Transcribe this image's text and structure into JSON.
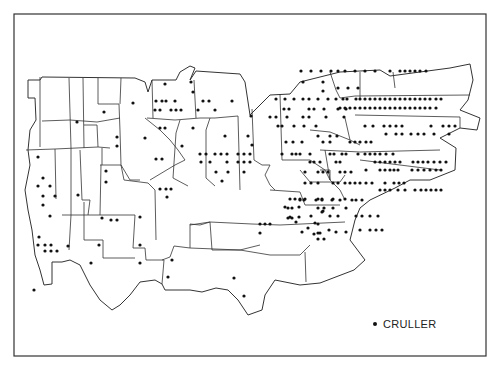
{
  "figure": {
    "type": "dot-distribution-map",
    "legend": {
      "symbol": "dot",
      "label": "CRULLER"
    },
    "colors": {
      "background": "#ffffff",
      "boundary": "#333333",
      "dot": "#111111"
    }
  },
  "map": {
    "frame": {
      "x": 14,
      "y": 14,
      "w": 472,
      "h": 342
    },
    "outline": "M28,80 L40,80 L42,77 L135,78 L145,82 L148,92 L152,80 L176,80 L180,72 L190,66 L195,68 L190,80 L196,71 L240,74 L245,82 L250,115 L270,95 L290,94 L300,82 L340,72 L380,70 L390,76 L420,72 L450,68 L470,64 L473,80 L468,100 L460,110 L480,118 L477,130 L460,128 L440,138 L456,148 L455,170 L430,180 L410,180 L395,188 L370,200 L360,208 L355,220 L350,240 L365,260 L354,270 L320,283 L300,285 L275,280 L265,295 L262,310 L248,315 L238,300 L228,290 L216,288 L202,292 L190,290 L180,290 L165,290 L162,284 L155,280 L140,282 L130,295 L120,305 L112,310 L100,300 L90,285 L80,265 L70,260 L62,262 L52,262 L52,284 L44,285 L40,270 L35,255 L32,230 L28,210 L25,190 L30,165 L28,150 L30,130 L36,120 L35,98 L28,98 Z",
    "boundaries": [
      "M42,121 L70,120 L97,122 L120,118",
      "M40,77 L40,147",
      "M69,78 L71,148",
      "M83,78 L84,148",
      "M98,78 L98,104 L119,104 L120,131 L121,165",
      "M121,78 L120,104",
      "M84,125 L97,125 L98,147",
      "M26,150 L55,149 L56,199",
      "M55,149 L98,147 L110,148",
      "M71,148 L71,215 L69,250",
      "M80,150 L82,200 L90,200 L88,215",
      "M102,148 L102,165",
      "M100,165 L121,165 L130,180 L140,180",
      "M121,165 L124,180 L148,183 L155,190 L156,240",
      "M101,165 L100,215",
      "M62,215 L135,215",
      "M135,215 L133,248 L145,248 L146,260 L164,260 L162,284",
      "M162,260 L170,257 L174,246 L190,248 L190,224 L200,225 L210,222",
      "M190,225 L210,222 L252,224",
      "M84,202 L84,240 L103,240 L103,258 L135,258",
      "M150,180 L175,165 L185,160 L178,150 L170,140 L160,130 L145,118",
      "M147,118 L175,120 L200,118 L215,118 L238,116",
      "M153,118 L152,80",
      "M196,118 L194,80",
      "M180,120 L176,133 L173,178 L188,186",
      "M210,118 L206,130 L206,178 L215,186",
      "M238,116 L240,190",
      "M252,109 L254,160 L262,165 L270,165",
      "M280,94 L282,160 L310,160",
      "M310,160 L325,170 L330,180",
      "M270,165 L265,175 L270,185 L275,190",
      "M330,72 L336,90 L340,98 L355,96",
      "M360,72 L360,98",
      "M393,72 L395,88",
      "M355,96 L470,95",
      "M355,115 L460,117 L460,128",
      "M345,118 L350,140 L360,145",
      "M310,130 L330,132 L350,140",
      "M320,150 L360,152 L440,150",
      "M325,150 L330,180 L340,190 L345,200",
      "M360,160 L440,170",
      "M300,170 L310,182 L340,182 L345,175",
      "M320,170 L330,170 L330,180",
      "M270,190 L300,192 L305,205 L340,205",
      "M252,224 L280,225 L345,222",
      "M210,222 L212,250 L240,250 L260,245",
      "M240,250 L270,255 L300,255 L310,245",
      "M305,252 L306,282",
      "M190,248 L240,250"
    ],
    "dots": [
      [
        165,
        84
      ],
      [
        191,
        82
      ],
      [
        193,
        92
      ],
      [
        156,
        101
      ],
      [
        162,
        101
      ],
      [
        166,
        101
      ],
      [
        175,
        101
      ],
      [
        203,
        101
      ],
      [
        209,
        101
      ],
      [
        232,
        101
      ],
      [
        155,
        110
      ],
      [
        160,
        110
      ],
      [
        171,
        110
      ],
      [
        176,
        110
      ],
      [
        181,
        110
      ],
      [
        198,
        110
      ],
      [
        215,
        110
      ],
      [
        133,
        103
      ],
      [
        77,
        122
      ],
      [
        104,
        112
      ],
      [
        117,
        137
      ],
      [
        117,
        146
      ],
      [
        145,
        138
      ],
      [
        182,
        146
      ],
      [
        160,
        128
      ],
      [
        165,
        128
      ],
      [
        193,
        128
      ],
      [
        225,
        136
      ],
      [
        248,
        136
      ],
      [
        200,
        154
      ],
      [
        206,
        154
      ],
      [
        215,
        154
      ],
      [
        221,
        154
      ],
      [
        227,
        154
      ],
      [
        238,
        154
      ],
      [
        244,
        154
      ],
      [
        250,
        154
      ],
      [
        201,
        162
      ],
      [
        210,
        162
      ],
      [
        227,
        162
      ],
      [
        238,
        162
      ],
      [
        244,
        162
      ],
      [
        250,
        162
      ],
      [
        216,
        172
      ],
      [
        228,
        172
      ],
      [
        244,
        172
      ],
      [
        222,
        181
      ],
      [
        38,
        157
      ],
      [
        43,
        178
      ],
      [
        38,
        186
      ],
      [
        50,
        186
      ],
      [
        43,
        196
      ],
      [
        55,
        196
      ],
      [
        43,
        205
      ],
      [
        50,
        216
      ],
      [
        78,
        195
      ],
      [
        106,
        171
      ],
      [
        106,
        182
      ],
      [
        111,
        220
      ],
      [
        117,
        220
      ],
      [
        156,
        159
      ],
      [
        162,
        159
      ],
      [
        160,
        189
      ],
      [
        166,
        189
      ],
      [
        171,
        189
      ],
      [
        167,
        197
      ],
      [
        34,
        290
      ],
      [
        39,
        237
      ],
      [
        38,
        245
      ],
      [
        45,
        245
      ],
      [
        51,
        245
      ],
      [
        45,
        251
      ],
      [
        51,
        251
      ],
      [
        57,
        251
      ],
      [
        68,
        246
      ],
      [
        102,
        218
      ],
      [
        99,
        245
      ],
      [
        140,
        217
      ],
      [
        140,
        245
      ],
      [
        91,
        263
      ],
      [
        140,
        263
      ],
      [
        172,
        260
      ],
      [
        168,
        277
      ],
      [
        234,
        278
      ],
      [
        244,
        296
      ],
      [
        251,
        116
      ],
      [
        252,
        145
      ],
      [
        303,
        82
      ],
      [
        323,
        82
      ],
      [
        323,
        91
      ],
      [
        338,
        88
      ],
      [
        348,
        88
      ],
      [
        358,
        88
      ],
      [
        343,
        99
      ],
      [
        347,
        99
      ],
      [
        356,
        99
      ],
      [
        360,
        99
      ],
      [
        365,
        99
      ],
      [
        370,
        99
      ],
      [
        375,
        99
      ],
      [
        380,
        99
      ],
      [
        385,
        99
      ],
      [
        390,
        99
      ],
      [
        395,
        99
      ],
      [
        400,
        99
      ],
      [
        405,
        99
      ],
      [
        410,
        99
      ],
      [
        415,
        99
      ],
      [
        420,
        99
      ],
      [
        425,
        99
      ],
      [
        430,
        99
      ],
      [
        436,
        99
      ],
      [
        441,
        99
      ],
      [
        340,
        108
      ],
      [
        345,
        108
      ],
      [
        350,
        108
      ],
      [
        355,
        108
      ],
      [
        360,
        108
      ],
      [
        365,
        108
      ],
      [
        370,
        108
      ],
      [
        375,
        108
      ],
      [
        380,
        108
      ],
      [
        385,
        108
      ],
      [
        390,
        108
      ],
      [
        395,
        108
      ],
      [
        400,
        108
      ],
      [
        405,
        108
      ],
      [
        410,
        108
      ],
      [
        415,
        108
      ],
      [
        420,
        108
      ],
      [
        425,
        108
      ],
      [
        430,
        108
      ],
      [
        436,
        108
      ],
      [
        301,
        71
      ],
      [
        311,
        71
      ],
      [
        321,
        71
      ],
      [
        331,
        71
      ],
      [
        338,
        71
      ],
      [
        345,
        71
      ],
      [
        355,
        71
      ],
      [
        365,
        71
      ],
      [
        375,
        71
      ],
      [
        390,
        71
      ],
      [
        400,
        71
      ],
      [
        405,
        71
      ],
      [
        410,
        71
      ],
      [
        415,
        71
      ],
      [
        420,
        71
      ],
      [
        426,
        71
      ],
      [
        276,
        99
      ],
      [
        285,
        99
      ],
      [
        294,
        99
      ],
      [
        303,
        99
      ],
      [
        309,
        99
      ],
      [
        318,
        99
      ],
      [
        328,
        99
      ],
      [
        336,
        99
      ],
      [
        284,
        109
      ],
      [
        289,
        109
      ],
      [
        309,
        109
      ],
      [
        314,
        109
      ],
      [
        324,
        109
      ],
      [
        338,
        109
      ],
      [
        346,
        109
      ],
      [
        270,
        117
      ],
      [
        276,
        117
      ],
      [
        287,
        117
      ],
      [
        303,
        117
      ],
      [
        309,
        117
      ],
      [
        326,
        117
      ],
      [
        344,
        117
      ],
      [
        365,
        126
      ],
      [
        373,
        126
      ],
      [
        384,
        126
      ],
      [
        390,
        126
      ],
      [
        396,
        126
      ],
      [
        402,
        126
      ],
      [
        431,
        126
      ],
      [
        443,
        126
      ],
      [
        449,
        126
      ],
      [
        455,
        126
      ],
      [
        386,
        134
      ],
      [
        396,
        134
      ],
      [
        402,
        134
      ],
      [
        411,
        134
      ],
      [
        418,
        134
      ],
      [
        424,
        134
      ],
      [
        434,
        134
      ],
      [
        449,
        134
      ],
      [
        278,
        126
      ],
      [
        282,
        126
      ],
      [
        294,
        126
      ],
      [
        304,
        126
      ],
      [
        316,
        126
      ],
      [
        318,
        136
      ],
      [
        330,
        136
      ],
      [
        337,
        136
      ],
      [
        286,
        142
      ],
      [
        293,
        142
      ],
      [
        302,
        142
      ],
      [
        323,
        142
      ],
      [
        330,
        142
      ],
      [
        350,
        142
      ],
      [
        355,
        142
      ],
      [
        360,
        142
      ],
      [
        366,
        142
      ],
      [
        371,
        142
      ],
      [
        282,
        154
      ],
      [
        292,
        154
      ],
      [
        296,
        154
      ],
      [
        300,
        154
      ],
      [
        310,
        154
      ],
      [
        330,
        154
      ],
      [
        334,
        154
      ],
      [
        342,
        154
      ],
      [
        346,
        154
      ],
      [
        358,
        154
      ],
      [
        365,
        154
      ],
      [
        370,
        154
      ],
      [
        375,
        154
      ],
      [
        380,
        154
      ],
      [
        386,
        154
      ],
      [
        393,
        154
      ],
      [
        310,
        162
      ],
      [
        314,
        162
      ],
      [
        320,
        162
      ],
      [
        336,
        162
      ],
      [
        340,
        162
      ],
      [
        375,
        162
      ],
      [
        380,
        162
      ],
      [
        385,
        162
      ],
      [
        390,
        162
      ],
      [
        395,
        162
      ],
      [
        400,
        162
      ],
      [
        413,
        162
      ],
      [
        418,
        162
      ],
      [
        423,
        162
      ],
      [
        428,
        162
      ],
      [
        434,
        162
      ],
      [
        440,
        162
      ],
      [
        446,
        162
      ],
      [
        305,
        172
      ],
      [
        318,
        172
      ],
      [
        323,
        172
      ],
      [
        328,
        172
      ],
      [
        340,
        172
      ],
      [
        345,
        172
      ],
      [
        351,
        172
      ],
      [
        366,
        170
      ],
      [
        380,
        170
      ],
      [
        385,
        170
      ],
      [
        390,
        170
      ],
      [
        394,
        170
      ],
      [
        398,
        170
      ],
      [
        412,
        170
      ],
      [
        418,
        170
      ],
      [
        424,
        170
      ],
      [
        430,
        170
      ],
      [
        436,
        170
      ],
      [
        441,
        170
      ],
      [
        305,
        183
      ],
      [
        311,
        183
      ],
      [
        318,
        183
      ],
      [
        333,
        183
      ],
      [
        338,
        183
      ],
      [
        345,
        183
      ],
      [
        350,
        183
      ],
      [
        355,
        183
      ],
      [
        360,
        183
      ],
      [
        366,
        183
      ],
      [
        372,
        183
      ],
      [
        385,
        183
      ],
      [
        394,
        183
      ],
      [
        399,
        183
      ],
      [
        404,
        183
      ],
      [
        300,
        200
      ],
      [
        304,
        200
      ],
      [
        316,
        200
      ],
      [
        322,
        200
      ],
      [
        332,
        200
      ],
      [
        340,
        200
      ],
      [
        352,
        200
      ],
      [
        356,
        200
      ],
      [
        362,
        200
      ],
      [
        380,
        190
      ],
      [
        385,
        190
      ],
      [
        390,
        190
      ],
      [
        398,
        190
      ],
      [
        405,
        190
      ],
      [
        415,
        190
      ],
      [
        421,
        190
      ],
      [
        426,
        190
      ],
      [
        431,
        190
      ],
      [
        436,
        190
      ],
      [
        441,
        190
      ],
      [
        290,
        199
      ],
      [
        295,
        199
      ],
      [
        300,
        199
      ],
      [
        305,
        199
      ],
      [
        318,
        199
      ],
      [
        322,
        199
      ],
      [
        333,
        199
      ],
      [
        345,
        199
      ],
      [
        288,
        208
      ],
      [
        292,
        208
      ],
      [
        318,
        208
      ],
      [
        324,
        208
      ],
      [
        333,
        208
      ],
      [
        346,
        208
      ],
      [
        288,
        218
      ],
      [
        292,
        218
      ],
      [
        322,
        212
      ],
      [
        330,
        216
      ],
      [
        338,
        216
      ],
      [
        356,
        216
      ],
      [
        362,
        216
      ],
      [
        370,
        216
      ],
      [
        378,
        216
      ],
      [
        260,
        233
      ],
      [
        318,
        233
      ],
      [
        318,
        239
      ],
      [
        324,
        239
      ],
      [
        360,
        230
      ],
      [
        370,
        230
      ],
      [
        376,
        230
      ],
      [
        382,
        230
      ],
      [
        285,
        207
      ],
      [
        299,
        207
      ],
      [
        290,
        217
      ],
      [
        299,
        217
      ],
      [
        311,
        216
      ],
      [
        315,
        223
      ],
      [
        318,
        224
      ],
      [
        323,
        211
      ],
      [
        296,
        222
      ],
      [
        302,
        232
      ],
      [
        320,
        233
      ],
      [
        329,
        230
      ],
      [
        336,
        232
      ],
      [
        346,
        232
      ],
      [
        260,
        224
      ],
      [
        265,
        224
      ],
      [
        270,
        224
      ],
      [
        314,
        234
      ],
      [
        308,
        228
      ]
    ]
  }
}
